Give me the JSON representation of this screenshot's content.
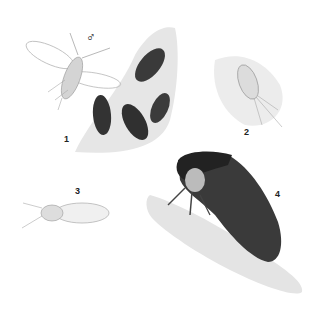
{
  "plate": {
    "figures": [
      {
        "number": "1",
        "symbol": "♂",
        "subject": "winged male insect with dark scale-like females on bark"
      },
      {
        "number": "2",
        "subject": "oval bristled nymph with long tail filaments"
      },
      {
        "number": "3",
        "subject": "small winged insect, side view"
      },
      {
        "number": "4",
        "subject": "dark treehopper on twig"
      }
    ]
  }
}
